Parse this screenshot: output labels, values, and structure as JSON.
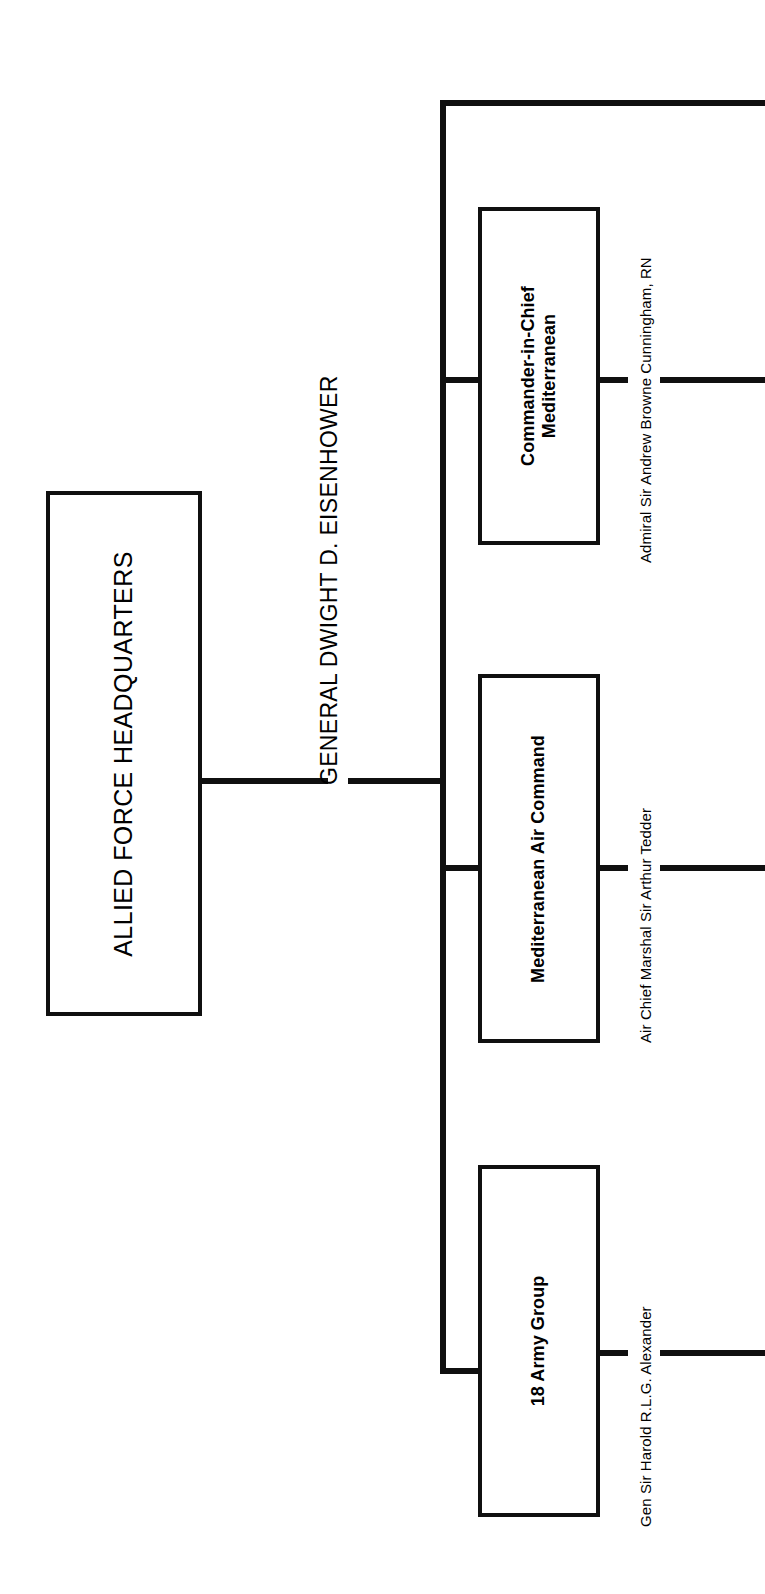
{
  "diagram": {
    "orientation": "rotated-90-ccw",
    "background_color": "#ffffff",
    "line_color": "#101010",
    "root": {
      "title": "ALLIED FORCE HEADQUARTERS",
      "commander": "GENERAL DWIGHT D. EISENHOWER"
    },
    "subordinates": [
      {
        "title": "Commander-in-Chief Mediterranean",
        "title_line_1": "Commander-in-Chief",
        "title_line_2": "Mediterranean",
        "commander": "Admiral Sir Andrew Browne Cunningham, RN"
      },
      {
        "title": "Mediterranean Air Command",
        "title_line_1": "Mediterranean Air Command",
        "title_line_2": "",
        "commander": "Air Chief Marshal Sir Arthur Tedder"
      },
      {
        "title": "18 Army Group",
        "title_line_1": "18 Army Group",
        "title_line_2": "",
        "commander": "Gen Sir Harold R.L.G. Alexander"
      }
    ]
  }
}
